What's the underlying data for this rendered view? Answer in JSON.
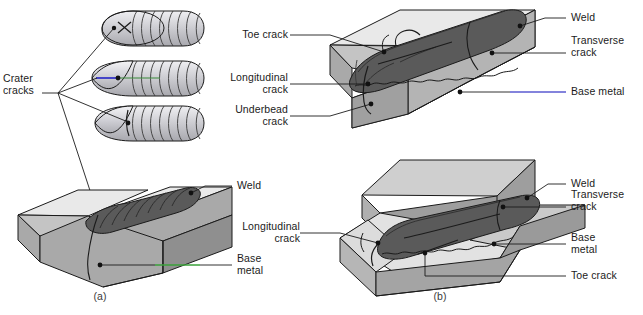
{
  "figure": {
    "title_caption_a": "(a)",
    "title_caption_b": "(b)"
  },
  "panel_a": {
    "crater_label": "Crater\ncracks",
    "weld_label": "Weld",
    "base_metal_label": "Base\nmetal",
    "beads": [
      {
        "name": "star-crater-crack-bead",
        "crack_type": "star"
      },
      {
        "name": "longitudinal-crater-crack-bead",
        "crack_type": "longitudinal"
      },
      {
        "name": "transverse-crater-crack-bead",
        "crack_type": "transverse"
      }
    ],
    "joint_type": "butt-joint-v-groove"
  },
  "panel_b_top": {
    "toe_crack_label": "Toe crack",
    "longitudinal_crack_label": "Longitudinal\ncrack",
    "underbead_crack_label": "Underbead\ncrack",
    "weld_label": "Weld",
    "transverse_crack_label": "Transverse\ncrack",
    "base_metal_label": "Base metal",
    "joint_type": "butt-joint-plate"
  },
  "panel_b_bottom": {
    "longitudinal_crack_label": "Longitudinal\ncrack",
    "weld_label": "Weld",
    "transverse_crack_label": "Transverse\ncrack",
    "base_metal_label": "Base\nmetal",
    "toe_crack_label": "Toe crack",
    "joint_type": "tee-joint-fillet"
  },
  "colors": {
    "top_face": "#e9e9e9",
    "front_face": "#a9a9a9",
    "side_face": "#c4c4c4",
    "weld_dark": "#5a5a5a",
    "weld_mid": "#6e6e6e",
    "bead_light": "#c9c9cd",
    "outline": "#1b1b1b",
    "leader_green": "#3aa03a",
    "leader_blue": "#5a5ad0",
    "text": "#1b1b1b"
  }
}
